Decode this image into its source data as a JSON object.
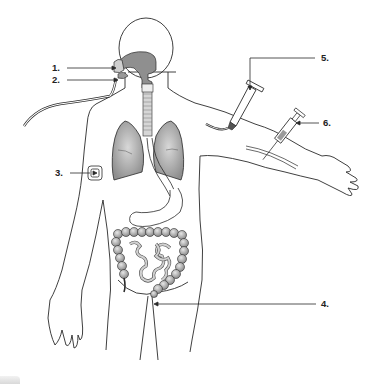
{
  "diagram": {
    "type": "medical-illustration",
    "colors": {
      "outline": "#2a2a2a",
      "organ_fill": "#9a9a9a",
      "organ_light": "#cfcfcf",
      "background": "#ffffff"
    },
    "labels": [
      {
        "id": "1",
        "text": "1.",
        "points_to": "inhalation mask / nasal airway"
      },
      {
        "id": "2",
        "text": "2.",
        "points_to": "mouth / tube at lips"
      },
      {
        "id": "3",
        "text": "3.",
        "points_to": "transdermal patch on upper arm"
      },
      {
        "id": "4",
        "text": "4.",
        "points_to": "rectum"
      },
      {
        "id": "5",
        "text": "5.",
        "points_to": "IV infusion bag"
      },
      {
        "id": "6",
        "text": "6.",
        "points_to": "syringe injection"
      }
    ]
  }
}
